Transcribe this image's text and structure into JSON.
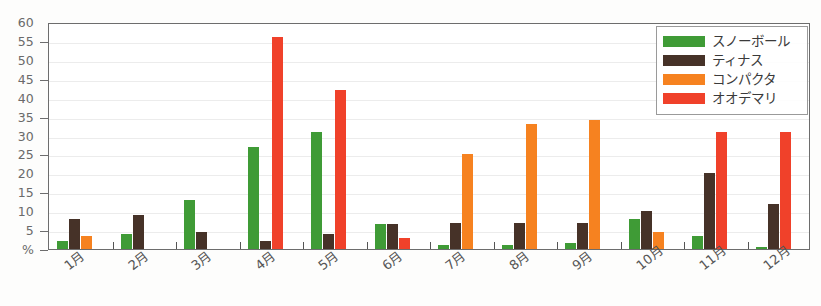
{
  "chart_data": {
    "type": "bar",
    "title": "",
    "subtitle": "",
    "xlabel": "",
    "ylabel": "%",
    "ylim": [
      0,
      60
    ],
    "ytick_step": 5,
    "ytick_labels": [
      "60",
      "55",
      "50",
      "45",
      "40",
      "35",
      "30",
      "25",
      "20",
      "15",
      "10",
      "5",
      "%"
    ],
    "grid": true,
    "legend_position": "top-right",
    "categories": [
      "1月",
      "2月",
      "3月",
      "4月",
      "5月",
      "6月",
      "7月",
      "8月",
      "9月",
      "10月",
      "11月",
      "12月"
    ],
    "series": [
      {
        "name": "スノーボール",
        "color": "#3f9b36",
        "values": [
          2,
          4,
          13,
          27,
          31,
          6.5,
          1,
          1,
          1.5,
          8,
          3.5,
          0.5
        ]
      },
      {
        "name": "ティナス",
        "color": "#463228",
        "values": [
          8,
          9,
          4.5,
          2,
          4,
          6.5,
          7,
          7,
          7,
          10,
          20,
          12
        ]
      },
      {
        "name": "コンパクタ",
        "color": "#f68220",
        "values": [
          3.5,
          0,
          0,
          0,
          0,
          0,
          25,
          33,
          34,
          4.5,
          0,
          0
        ]
      },
      {
        "name": "オオデマリ",
        "color": "#f0412a",
        "values": [
          0,
          0,
          0,
          56,
          42,
          3,
          0,
          0,
          0,
          0,
          31,
          31
        ]
      }
    ]
  },
  "legend": {
    "items": [
      {
        "label": "スノーボール",
        "color": "#3f9b36"
      },
      {
        "label": "ティナス",
        "color": "#463228"
      },
      {
        "label": "コンパクタ",
        "color": "#f68220"
      },
      {
        "label": "オオデマリ",
        "color": "#f0412a"
      }
    ]
  }
}
